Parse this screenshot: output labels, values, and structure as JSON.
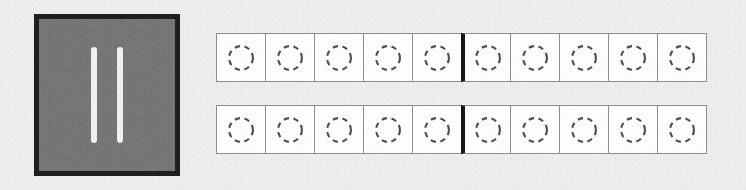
{
  "canvas": {
    "width": 746,
    "height": 190,
    "background_color": "#eeeeee",
    "texture": "fine-grain-noise"
  },
  "pause_panel": {
    "name": "pause-indicator",
    "icon": "pause-icon",
    "border_color": "#191919",
    "fill_color": "#737373",
    "bar_color": "#f2f2f0",
    "bar_count": 2,
    "bars": [
      {
        "index": 1
      },
      {
        "index": 2
      }
    ]
  },
  "slot_board": {
    "name": "slot-board",
    "cell_border_color": "#8c8c8c",
    "cell_fill_color": "#ffffff",
    "marker_color": "#4a4a4a",
    "marker_style": "dashed-circle",
    "divider_color": "#111111",
    "divider_after_column": 5,
    "columns": 10,
    "rows": [
      {
        "name": "slot-row-1",
        "index": 1,
        "cells": [
          {
            "column": 1,
            "state": "empty",
            "marker": "dashed-circle"
          },
          {
            "column": 2,
            "state": "empty",
            "marker": "dashed-circle"
          },
          {
            "column": 3,
            "state": "empty",
            "marker": "dashed-circle"
          },
          {
            "column": 4,
            "state": "empty",
            "marker": "dashed-circle"
          },
          {
            "column": 5,
            "state": "empty",
            "marker": "dashed-circle"
          },
          {
            "column": 6,
            "state": "empty",
            "marker": "dashed-circle",
            "group_start": true
          },
          {
            "column": 7,
            "state": "empty",
            "marker": "dashed-circle"
          },
          {
            "column": 8,
            "state": "empty",
            "marker": "dashed-circle"
          },
          {
            "column": 9,
            "state": "empty",
            "marker": "dashed-circle"
          },
          {
            "column": 10,
            "state": "empty",
            "marker": "dashed-circle"
          }
        ]
      },
      {
        "name": "slot-row-2",
        "index": 2,
        "cells": [
          {
            "column": 1,
            "state": "empty",
            "marker": "dashed-circle"
          },
          {
            "column": 2,
            "state": "empty",
            "marker": "dashed-circle"
          },
          {
            "column": 3,
            "state": "empty",
            "marker": "dashed-circle"
          },
          {
            "column": 4,
            "state": "empty",
            "marker": "dashed-circle"
          },
          {
            "column": 5,
            "state": "empty",
            "marker": "dashed-circle"
          },
          {
            "column": 6,
            "state": "empty",
            "marker": "dashed-circle",
            "group_start": true
          },
          {
            "column": 7,
            "state": "empty",
            "marker": "dashed-circle"
          },
          {
            "column": 8,
            "state": "empty",
            "marker": "dashed-circle"
          },
          {
            "column": 9,
            "state": "empty",
            "marker": "dashed-circle"
          },
          {
            "column": 10,
            "state": "empty",
            "marker": "dashed-circle"
          }
        ]
      }
    ]
  }
}
